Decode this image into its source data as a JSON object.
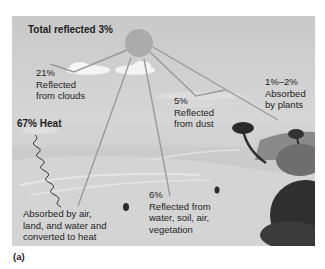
{
  "figure": {
    "caption": "(a)",
    "labels": {
      "total_reflected": "Total reflected 3%",
      "clouds_pct": "21%",
      "clouds_l1": "Reflected",
      "clouds_l2": "from clouds",
      "dust_pct": "5%",
      "dust_l1": "Reflected",
      "dust_l2": "from dust",
      "plants_pct": "1%–2%",
      "plants_l1": "Absorbed",
      "plants_l2": "by plants",
      "heat": "67% Heat",
      "absorbed_l1": "Absorbed by air,",
      "absorbed_l2": "land, and water and",
      "absorbed_l3": "converted to heat",
      "surface_pct": "6%",
      "surface_l1": "Reflected from",
      "surface_l2": "water, soil, air,",
      "surface_l3": "vegetation"
    },
    "colors": {
      "sky": "#cfcfcf",
      "sun": "#a9a9a9",
      "ray": "#9a9a9a",
      "cloud": "#f4f4f4",
      "vegetation": "#3a3a3a",
      "text": "#1e1e1e"
    }
  }
}
